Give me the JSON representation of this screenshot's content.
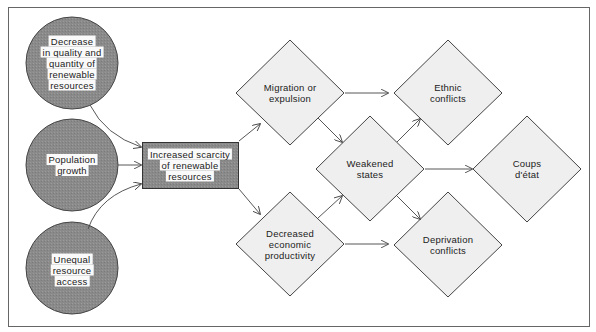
{
  "diagram": {
    "frame": {
      "border_color": "#555555",
      "background": "#ffffff"
    },
    "colors": {
      "circle_fill": "#8c8c8c",
      "box_fill": "#8c8c8c",
      "diamond_fill": "#efefef",
      "stroke": "#444444",
      "label_bg": "#fafafa"
    },
    "causes": [
      {
        "id": "decrease",
        "lines": [
          "Decrease",
          "in quality and",
          "quantity of",
          "renewable",
          "resources"
        ]
      },
      {
        "id": "population",
        "lines": [
          "Population",
          "growth"
        ]
      },
      {
        "id": "unequal",
        "lines": [
          "Unequal",
          "resource",
          "access"
        ]
      }
    ],
    "central": {
      "id": "scarcity",
      "lines": [
        "Increased scarcity",
        "of renewable",
        "resources"
      ]
    },
    "effects": [
      {
        "id": "migration",
        "lines": [
          "Migration or",
          "expulsion"
        ]
      },
      {
        "id": "productivity",
        "lines": [
          "Decreased",
          "economic",
          "productivity"
        ]
      },
      {
        "id": "weakened",
        "lines": [
          "Weakened",
          "states"
        ]
      },
      {
        "id": "ethnic",
        "lines": [
          "Ethnic",
          "conflicts"
        ]
      },
      {
        "id": "deprivation",
        "lines": [
          "Deprivation",
          "conflicts"
        ]
      },
      {
        "id": "coups",
        "lines": [
          "Coups",
          "d'état"
        ]
      }
    ],
    "edges": [
      [
        "decrease",
        "scarcity"
      ],
      [
        "population",
        "scarcity"
      ],
      [
        "unequal",
        "scarcity"
      ],
      [
        "scarcity",
        "migration"
      ],
      [
        "scarcity",
        "productivity"
      ],
      [
        "migration",
        "ethnic"
      ],
      [
        "migration",
        "weakened"
      ],
      [
        "productivity",
        "weakened"
      ],
      [
        "productivity",
        "deprivation"
      ],
      [
        "weakened",
        "ethnic"
      ],
      [
        "weakened",
        "deprivation"
      ],
      [
        "weakened",
        "coups"
      ]
    ]
  }
}
